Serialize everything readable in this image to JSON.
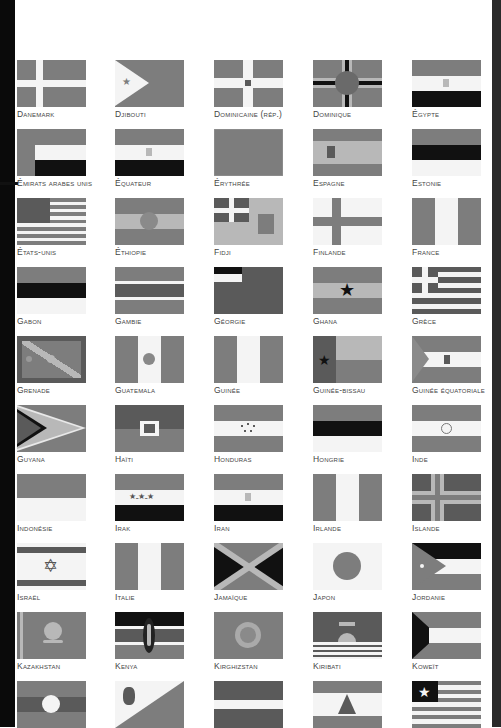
{
  "page": {
    "type": "flags-atlas-page",
    "color_mode": "grayscale"
  },
  "flags": [
    {
      "label": "Danemark",
      "pattern": "nordic-cross-light"
    },
    {
      "label": "Djibouti",
      "pattern": "triangle-star-bicolor"
    },
    {
      "label": "dominicaine (Rép.)",
      "pattern": "centered-cross-emblem"
    },
    {
      "label": "Dominique",
      "pattern": "tricolor-cross-disc"
    },
    {
      "label": "Égypte",
      "pattern": "tricolor-horizontal-emblem"
    },
    {
      "label": "Émirats arabes unis",
      "pattern": "vertical-band-tricolor"
    },
    {
      "label": "Équateur",
      "pattern": "tricolor-horizontal-emblem"
    },
    {
      "label": "Érythrée",
      "pattern": "triangle-emblem"
    },
    {
      "label": "Espagne",
      "pattern": "triband-emblem"
    },
    {
      "label": "Estonie",
      "pattern": "tricolor-horizontal"
    },
    {
      "label": "États-Unis",
      "pattern": "stars-stripes"
    },
    {
      "label": "Éthiopie",
      "pattern": "tricolor-horizontal-disc"
    },
    {
      "label": "Fidji",
      "pattern": "union-jack-shield"
    },
    {
      "label": "Finlande",
      "pattern": "nordic-cross"
    },
    {
      "label": "France",
      "pattern": "tricolor-vertical"
    },
    {
      "label": "Gabon",
      "pattern": "tricolor-horizontal"
    },
    {
      "label": "Gambie",
      "pattern": "tricolor-fimbriated"
    },
    {
      "label": "Géorgie",
      "pattern": "canton-bicolor"
    },
    {
      "label": "Ghana",
      "pattern": "tricolor-horizontal-star"
    },
    {
      "label": "Grèce",
      "pattern": "stripes-cross-canton"
    },
    {
      "label": "Grenade",
      "pattern": "saltire-border-stars"
    },
    {
      "label": "Guatemala",
      "pattern": "tricolor-vertical-emblem"
    },
    {
      "label": "Guinée",
      "pattern": "tricolor-vertical"
    },
    {
      "label": "Guinée-Bissau",
      "pattern": "vertical-band-star"
    },
    {
      "label": "Guinée équatoriale",
      "pattern": "triangle-tricolor-emblem"
    },
    {
      "label": "Guyana",
      "pattern": "arrowhead"
    },
    {
      "label": "Haïti",
      "pattern": "bicolor-emblem"
    },
    {
      "label": "Honduras",
      "pattern": "tricolor-horizontal-stars"
    },
    {
      "label": "Hongrie",
      "pattern": "tricolor-horizontal"
    },
    {
      "label": "Inde",
      "pattern": "tricolor-horizontal-wheel"
    },
    {
      "label": "Indonésie",
      "pattern": "bicolor-horizontal"
    },
    {
      "label": "Irak",
      "pattern": "tricolor-horizontal-script"
    },
    {
      "label": "Iran",
      "pattern": "tricolor-horizontal-emblem"
    },
    {
      "label": "Irlande",
      "pattern": "tricolor-vertical"
    },
    {
      "label": "Islande",
      "pattern": "nordic-cross-fimbriated"
    },
    {
      "label": "Israël",
      "pattern": "stripes-star-of-david"
    },
    {
      "label": "Italie",
      "pattern": "tricolor-vertical"
    },
    {
      "label": "Jamaïque",
      "pattern": "saltire"
    },
    {
      "label": "Japon",
      "pattern": "disc"
    },
    {
      "label": "Jordanie",
      "pattern": "triangle-tricolor-star"
    },
    {
      "label": "Kazakhstan",
      "pattern": "sun-eagle-ornament"
    },
    {
      "label": "Kenya",
      "pattern": "fimbriated-shield"
    },
    {
      "label": "Kirghizstan",
      "pattern": "sun-disc"
    },
    {
      "label": "Kiribati",
      "pattern": "bird-sun-waves"
    },
    {
      "label": "Koweït",
      "pattern": "trapezoid-tricolor"
    },
    {
      "label": "",
      "pattern": "triband-disc"
    },
    {
      "label": "",
      "pattern": "diagonal-shield"
    },
    {
      "label": "",
      "pattern": "triband-narrow-white"
    },
    {
      "label": "",
      "pattern": "triband-cedar"
    },
    {
      "label": "",
      "pattern": "stripes-star-canton"
    }
  ],
  "layout": {
    "columns_x": [
      17,
      115,
      214,
      313,
      412
    ],
    "rows_y": [
      60,
      129,
      198,
      267,
      336,
      405,
      474,
      543,
      612,
      681
    ]
  }
}
